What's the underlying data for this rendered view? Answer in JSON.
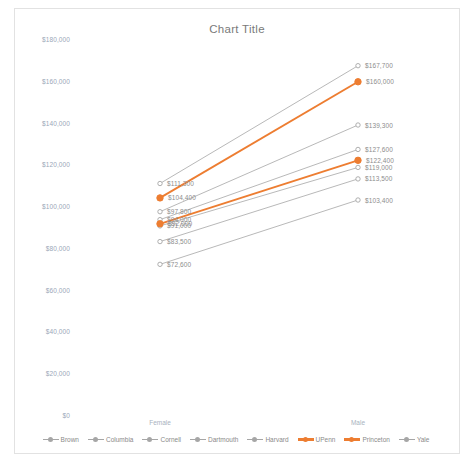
{
  "chart": {
    "title": "Chart Title",
    "frame_border_color": "#e2e2e2"
  },
  "axis": {
    "x_categories": [
      "Female",
      "Male"
    ],
    "y_ticks": [
      "$180,000",
      "$160,000",
      "$140,000",
      "$120,000",
      "$100,000",
      "$80,000",
      "$60,000",
      "$40,000",
      "$20,000",
      "$0"
    ]
  },
  "legend": {
    "items": [
      {
        "label": "Brown",
        "color": "#a6a6a6"
      },
      {
        "label": "Columbia",
        "color": "#a6a6a6"
      },
      {
        "label": "Cornell",
        "color": "#a6a6a6"
      },
      {
        "label": "Dartmouth",
        "color": "#a6a6a6"
      },
      {
        "label": "Harvard",
        "color": "#a6a6a6"
      },
      {
        "label": "UPenn",
        "color": "#ed7d31"
      },
      {
        "label": "Princeton",
        "color": "#ed7d31"
      },
      {
        "label": "Yale",
        "color": "#a6a6a6"
      }
    ]
  },
  "chart_data": {
    "type": "line",
    "title": "Chart Title",
    "xlabel": "",
    "ylabel": "",
    "categories": [
      "Female",
      "Male"
    ],
    "ylim": [
      0,
      180000
    ],
    "ytick_step": 20000,
    "grid": false,
    "legend_position": "bottom",
    "series": [
      {
        "name": "Brown",
        "color": "#a6a6a6",
        "values": [
          111300,
          167700
        ],
        "labels": [
          "$111,300",
          "$167,700"
        ]
      },
      {
        "name": "Columbia",
        "color": "#a6a6a6",
        "values": [
          97800,
          139300
        ],
        "labels": [
          "$97,800",
          "$139,300"
        ]
      },
      {
        "name": "Cornell",
        "color": "#a6a6a6",
        "values": [
          94000,
          127600
        ],
        "labels": [
          "$94,000",
          "$127,600"
        ]
      },
      {
        "name": "Dartmouth",
        "color": "#a6a6a6",
        "values": [
          91000,
          119000
        ],
        "labels": [
          "$91,000",
          "$119,000"
        ]
      },
      {
        "name": "Harvard",
        "color": "#a6a6a6",
        "values": [
          83500,
          113500
        ],
        "labels": [
          "$83,500",
          "$113,500"
        ]
      },
      {
        "name": "UPenn",
        "color": "#ed7d31",
        "values": [
          104400,
          160000
        ],
        "labels": [
          "$104,400",
          "$160,000"
        ]
      },
      {
        "name": "Princeton",
        "color": "#ed7d31",
        "values": [
          92000,
          122400
        ],
        "labels": [
          "$92,000",
          "$122,400"
        ]
      },
      {
        "name": "Yale",
        "color": "#a6a6a6",
        "values": [
          72600,
          103400
        ],
        "labels": [
          "$72,600",
          "$103,400"
        ]
      }
    ]
  }
}
